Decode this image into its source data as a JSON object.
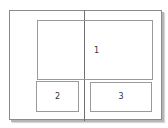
{
  "diagram": {
    "type": "two-page spread layout",
    "regions": [
      {
        "id": 1,
        "label": "1"
      },
      {
        "id": 2,
        "label": "2"
      },
      {
        "id": 3,
        "label": "3"
      }
    ]
  },
  "colors": {
    "page_border": "#8a8a8a",
    "spine": "#6f6f6f",
    "region_border": "#9a9a9a",
    "label_text": "#333333",
    "shadow": "#b5b5b5"
  }
}
